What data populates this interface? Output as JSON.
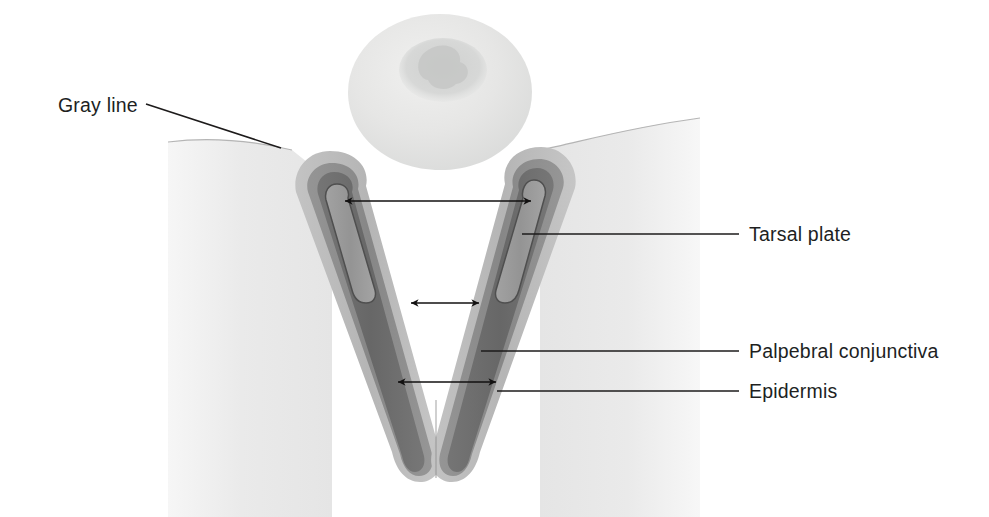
{
  "figure": {
    "background_color": "#ffffff"
  },
  "labels": [
    {
      "id": "gray-line",
      "text": "Gray line",
      "text_x": 58,
      "text_y": 112,
      "anchor": "start",
      "leader": "M 146 104 L 281 148",
      "description": "Leader from text down-right to the eyelid margin crest"
    },
    {
      "id": "tarsal-plate",
      "text": "Tarsal plate",
      "text_x": 749,
      "text_y": 241,
      "anchor": "start",
      "leader": "M 522 234 L 739 234",
      "description": "Horizontal leader from the right lid tarsal plate band"
    },
    {
      "id": "palpebral-conjunctiva",
      "text": "Palpebral conjunctiva",
      "text_x": 749,
      "text_y": 358,
      "anchor": "start",
      "leader": "M 481 351 L 739 351",
      "description": "Horizontal leader from the inner conjunctival band"
    },
    {
      "id": "epidermis",
      "text": "Epidermis",
      "text_x": 749,
      "text_y": 398,
      "anchor": "start",
      "leader": "M 497 391 L 739 391",
      "description": "Horizontal leader from the outer epidermal band"
    }
  ],
  "dimension_arrows": [
    {
      "id": "upper-span",
      "x1": 345,
      "x2": 531,
      "y": 201,
      "description": "Double-headed arrow across the inner tarsal cores near the lid margins"
    },
    {
      "id": "mid-span",
      "x1": 411,
      "x2": 479,
      "y": 303,
      "description": "Short double-headed arrow across the mid inter-lid gap"
    },
    {
      "id": "lower-span",
      "x1": 398,
      "x2": 496,
      "y": 382,
      "description": "Double-headed arrow near the V apex"
    }
  ],
  "structures": {
    "globe": {
      "name": "globe",
      "cx": 440,
      "cy": 92,
      "rx": 92,
      "ry": 78,
      "fill": "#e4e5e4",
      "cornea_fill": "#d2d3d2"
    },
    "skin_left": {
      "name": "skin-block-left",
      "fill": "#e9e9e9"
    },
    "skin_right": {
      "name": "skin-block-right",
      "fill": "#e9e9e9"
    },
    "lid_left": {
      "name": "eyelid-left"
    },
    "lid_right": {
      "name": "eyelid-right"
    }
  },
  "colors": {
    "epidermis": "#b9b9b9",
    "conjunctiva": "#8e8e8e",
    "tarsal_outer": "#6e6e6e",
    "tarsal_core": "#9a9a9a",
    "tarsal_core_stroke": "#4a4a4a",
    "skin": "#e9e9e9",
    "globe": "#e4e5e4",
    "cornea": "#d2d3d2",
    "ink": "#1d1b1b",
    "background": "#ffffff"
  }
}
